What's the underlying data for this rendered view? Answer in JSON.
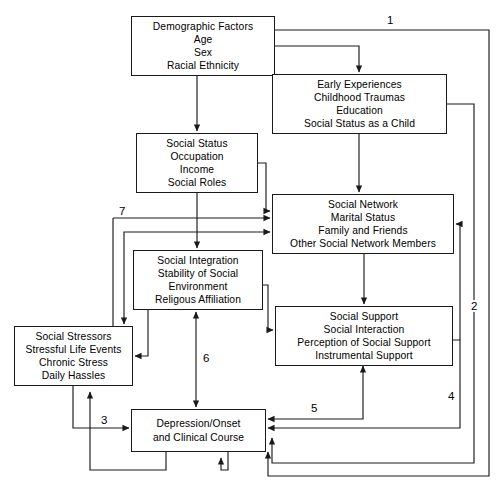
{
  "diagram": {
    "type": "flowchart",
    "canvas": {
      "width": 502,
      "height": 495
    },
    "colors": {
      "line": "#1a1a1a",
      "box_border": "#1a1a1a",
      "background": "#ffffff",
      "text": "#000000"
    },
    "nodes": [
      {
        "id": "demographic-factors",
        "lines": [
          "Demographic Factors",
          "Age",
          "Sex",
          "Racial Ethnicity"
        ],
        "x": 131,
        "y": 16,
        "w": 144,
        "h": 60
      },
      {
        "id": "early-experiences",
        "lines": [
          "Early Experiences",
          "Childhood Traumas",
          "Education",
          "Social Status as a Child"
        ],
        "x": 272,
        "y": 74,
        "w": 175,
        "h": 60
      },
      {
        "id": "social-status",
        "lines": [
          "Social Status",
          "Occupation",
          "Income",
          "Social Roles"
        ],
        "x": 136,
        "y": 133,
        "w": 122,
        "h": 60
      },
      {
        "id": "social-network",
        "lines": [
          "Social Network",
          "Marital Status",
          "Family and Friends",
          "Other Social Network Members"
        ],
        "x": 272,
        "y": 194,
        "w": 182,
        "h": 60
      },
      {
        "id": "social-integration",
        "lines": [
          "Social Integration",
          "Stability of Social",
          "Environment",
          "Religous Affiliation"
        ],
        "x": 133,
        "y": 250,
        "w": 130,
        "h": 60
      },
      {
        "id": "social-support",
        "lines": [
          "Social Support",
          "Social Interaction",
          "Perception of Social Support",
          "Instrumental Support"
        ],
        "x": 275,
        "y": 306,
        "w": 178,
        "h": 60
      },
      {
        "id": "social-stressors",
        "lines": [
          "Social Stressors",
          "Stressful Life Events",
          "Chronic Stress",
          "Daily Hassles"
        ],
        "x": 14,
        "y": 326,
        "w": 119,
        "h": 60
      },
      {
        "id": "depression",
        "lines": [
          "Depression/Onset",
          "and Clinical Course"
        ],
        "x": 131,
        "y": 409,
        "w": 135,
        "h": 43
      }
    ],
    "path_labels": [
      {
        "id": "label-1",
        "text": "1",
        "x": 385,
        "y": 14
      },
      {
        "id": "label-2",
        "text": "2",
        "x": 469,
        "y": 300
      },
      {
        "id": "label-3",
        "text": "3",
        "x": 99,
        "y": 414
      },
      {
        "id": "label-4",
        "text": "4",
        "x": 446,
        "y": 390
      },
      {
        "id": "label-5",
        "text": "5",
        "x": 309,
        "y": 402
      },
      {
        "id": "label-6",
        "text": "6",
        "x": 201,
        "y": 352
      },
      {
        "id": "label-7",
        "text": "7",
        "x": 117,
        "y": 205
      }
    ],
    "edges": [
      {
        "id": "edge-demographic-to-early",
        "from": "demographic-factors",
        "to": "early-experiences",
        "label": null
      },
      {
        "id": "edge-demographic-to-social-status",
        "from": "demographic-factors",
        "to": "social-status",
        "label": null
      },
      {
        "id": "edge-demographic-to-depression-1",
        "from": "demographic-factors",
        "to": "depression",
        "label": "1"
      },
      {
        "id": "edge-early-to-social-network",
        "from": "early-experiences",
        "to": "social-network",
        "label": null
      },
      {
        "id": "edge-early-to-depression-2",
        "from": "early-experiences",
        "to": "depression",
        "label": "2"
      },
      {
        "id": "edge-social-status-to-social-network",
        "from": "social-status",
        "to": "social-network",
        "label": null
      },
      {
        "id": "edge-social-status-to-social-integration",
        "from": "social-status",
        "to": "social-integration",
        "label": null
      },
      {
        "id": "edge-social-integration-to-social-network-7",
        "from": "social-integration",
        "to": "social-network",
        "label": "7"
      },
      {
        "id": "edge-social-integration-to-social-support",
        "from": "social-integration",
        "to": "social-support",
        "label": null
      },
      {
        "id": "edge-social-integration-to-social-stressors",
        "from": "social-integration",
        "to": "social-stressors",
        "label": null
      },
      {
        "id": "edge-social-integration-to-depression-6",
        "from": "social-integration",
        "to": "depression",
        "label": "6"
      },
      {
        "id": "edge-social-network-to-social-support",
        "from": "social-network",
        "to": "social-support",
        "label": null
      },
      {
        "id": "edge-social-network-to-social-stressors",
        "from": "social-network",
        "to": "social-stressors",
        "label": null
      },
      {
        "id": "edge-social-support-to-depression-5",
        "from": "social-support",
        "to": "depression",
        "label": "5"
      },
      {
        "id": "edge-social-support-to-social-network-4",
        "from": "social-support",
        "to": "social-network",
        "label": "4"
      },
      {
        "id": "edge-social-stressors-to-depression-3",
        "from": "social-stressors",
        "to": "depression",
        "label": "3"
      },
      {
        "id": "edge-depression-to-social-stressors",
        "from": "depression",
        "to": "social-stressors",
        "label": null
      },
      {
        "id": "edge-depression-to-social-integration",
        "from": "depression",
        "to": "social-integration",
        "label": null
      }
    ]
  }
}
